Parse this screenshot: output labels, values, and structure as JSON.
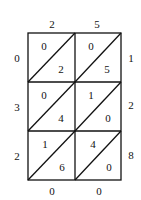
{
  "diagram": {
    "type": "lattice-multiplication",
    "top_digits": [
      "2",
      "5"
    ],
    "right_digits": [
      "1",
      "2",
      "8"
    ],
    "cells": [
      [
        {
          "tens": "0",
          "ones": "2"
        },
        {
          "tens": "0",
          "ones": "5"
        }
      ],
      [
        {
          "tens": "0",
          "ones": "4"
        },
        {
          "tens": "1",
          "ones": "0"
        }
      ],
      [
        {
          "tens": "1",
          "ones": "6"
        },
        {
          "tens": "4",
          "ones": "0"
        }
      ]
    ],
    "left_digits": [
      "0",
      "3",
      "2"
    ],
    "bottom_digits": [
      "0",
      "0"
    ],
    "line_color": "#111111"
  }
}
